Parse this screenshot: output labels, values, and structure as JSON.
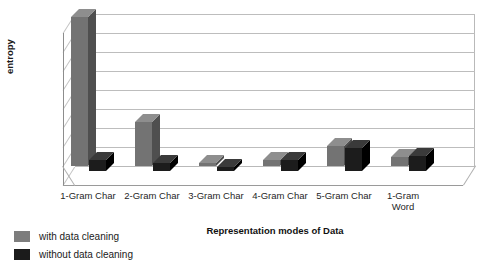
{
  "chart_data": {
    "type": "bar",
    "title": "",
    "xlabel": "Representation modes of Data",
    "ylabel": "entropy",
    "categories": [
      "1-Gram Char",
      "2-Gram Char",
      "3-Gram Char",
      "4-Gram Char",
      "5-Gram Char",
      "1-Gram Word"
    ],
    "series": [
      {
        "name": "with data cleaning",
        "color": "#737373",
        "values": [
          0.157,
          0.046,
          0.003,
          0.006,
          0.021,
          0.009
        ]
      },
      {
        "name": "without data cleaning",
        "color": "#1c1c1c",
        "values": [
          0.012,
          0.008,
          0.004,
          0.012,
          0.024,
          0.016
        ]
      }
    ],
    "yticks": [
      "0.16",
      "0.14",
      "0.12",
      "0.1",
      "0.08",
      "0.06",
      "0.04",
      "0.02",
      "0"
    ],
    "ytick_values": [
      0.16,
      0.14,
      0.12,
      0.1,
      0.08,
      0.06,
      0.04,
      0.02,
      0
    ],
    "ylim": [
      0,
      0.16
    ],
    "grid": true,
    "legend_position": "bottom-left",
    "style": "3d-column"
  },
  "legend": {
    "items": [
      {
        "label": "with data cleaning",
        "swatch": "gray"
      },
      {
        "label": "without data cleaning",
        "swatch": "black"
      }
    ]
  },
  "colors": {
    "series_with_cleaning": "#737373",
    "series_without_cleaning": "#1c1c1c",
    "gridline": "#bdbdbd",
    "axis": "#8d8d8d",
    "background": "#ffffff"
  }
}
